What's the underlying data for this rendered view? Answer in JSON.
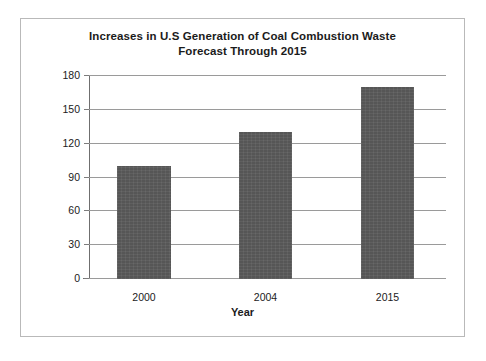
{
  "chart_data": {
    "type": "bar",
    "title": "Increases in U.S Generation of Coal Combustion Waste\nForecast Through 2015",
    "title_lines": [
      "Increases in U.S Generation of Coal Combustion Waste",
      "Forecast Through 2015"
    ],
    "categories": [
      "2000",
      "2004",
      "2015"
    ],
    "values": [
      100,
      130,
      170
    ],
    "xlabel": "Year",
    "ylabel": "",
    "ylim": [
      0,
      180
    ],
    "ytick_labels": [
      "0",
      "30",
      "60",
      "90",
      "120",
      "150",
      "180"
    ],
    "ytick_values": [
      0,
      30,
      60,
      90,
      120,
      150,
      180
    ],
    "grid": true,
    "legend": false,
    "bar_color": "#565656",
    "gridline_color": "#9a9a9a",
    "axis_color": "#6f6f6f",
    "border_color": "#b9b9b9",
    "background_color": "#ffffff",
    "text_color": "#1b1b1b"
  }
}
